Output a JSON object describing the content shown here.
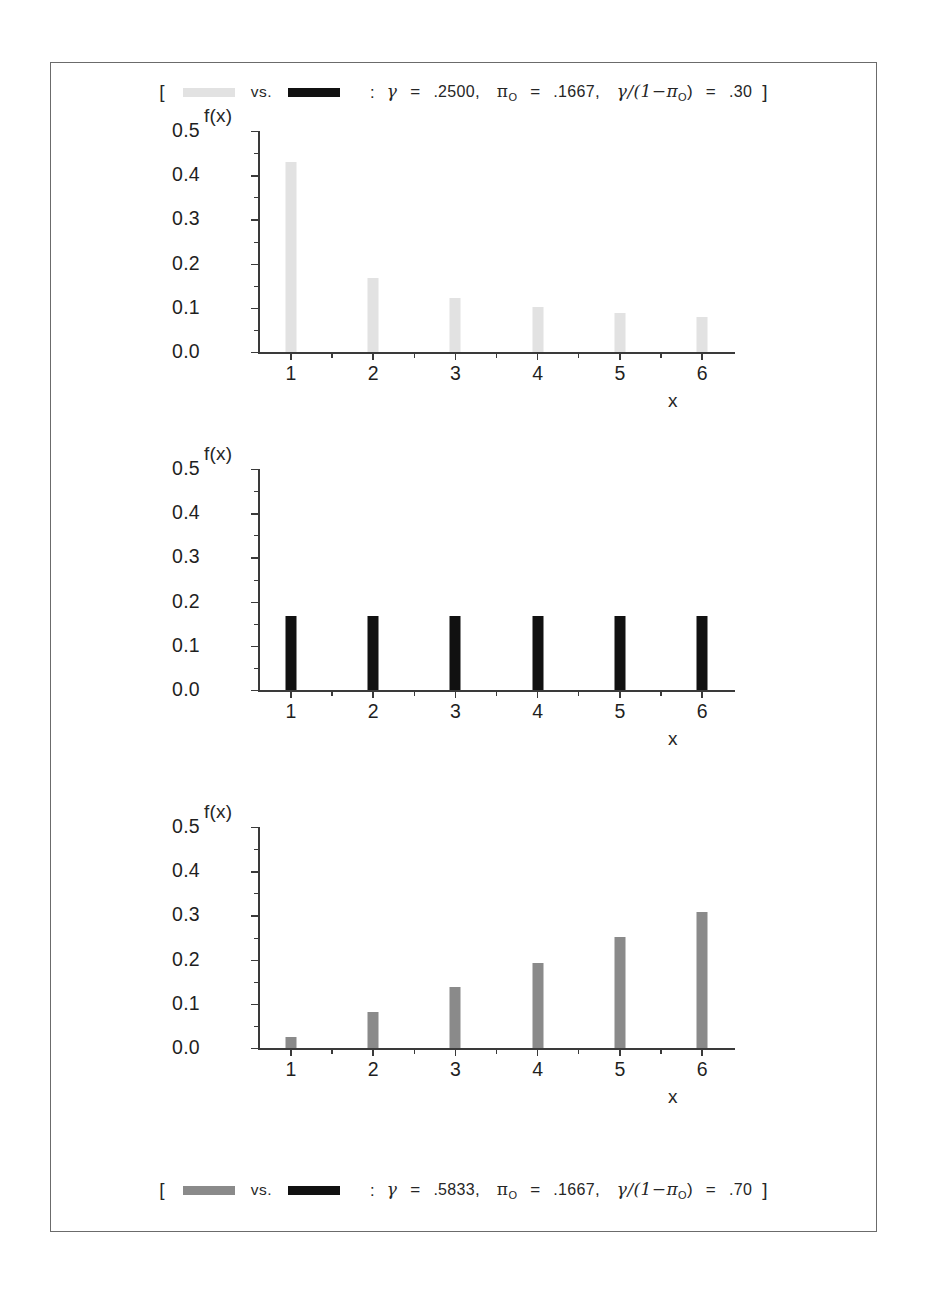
{
  "figure": {
    "caption_top": {
      "bracket_open": "[",
      "swatch_a_color": "#e2e2e2",
      "vs": "vs.",
      "swatch_b_color": "#111111",
      "colon": ":",
      "gamma": "γ",
      "eq1": "=",
      "gamma_value": ".2500",
      "comma1": ",",
      "pi": "π",
      "pi_sub": "O",
      "eq2": "=",
      "pi_value": ".1667",
      "comma2": ",",
      "ratio_expr": "γ/(1−π",
      "ratio_sub": "O",
      "ratio_close": ")",
      "eq3": "=",
      "ratio_value": ".30",
      "bracket_close": "]"
    },
    "caption_bottom": {
      "bracket_open": "[",
      "swatch_a_color": "#8a8a8a",
      "vs": "vs.",
      "swatch_b_color": "#111111",
      "colon": ":",
      "gamma": "γ",
      "eq1": "=",
      "gamma_value": ".5833",
      "comma1": ",",
      "pi": "π",
      "pi_sub": "O",
      "eq2": "=",
      "pi_value": ".1667",
      "comma2": ",",
      "ratio_expr": "γ/(1−π",
      "ratio_sub": "O",
      "ratio_close": ")",
      "eq3": "=",
      "ratio_value": ".70",
      "bracket_close": "]"
    }
  },
  "chart_data": [
    {
      "type": "bar",
      "title": "",
      "xlabel": "x",
      "ylabel": "f(x)",
      "categories": [
        "1",
        "2",
        "3",
        "4",
        "5",
        "6"
      ],
      "x": [
        1,
        2,
        3,
        4,
        5,
        6
      ],
      "values": [
        0.431,
        0.167,
        0.123,
        0.102,
        0.089,
        0.08
      ],
      "bar_color": "#e2e2e2",
      "ylim": [
        0.0,
        0.5
      ],
      "xlim": [
        0.6,
        6.4
      ],
      "yticks": [
        0.0,
        0.1,
        0.2,
        0.3,
        0.4,
        0.5
      ],
      "ytick_labels": [
        "0.0",
        "0.1",
        "0.2",
        "0.3",
        "0.4",
        "0.5"
      ],
      "grid": false,
      "legend": "none"
    },
    {
      "type": "bar",
      "title": "",
      "xlabel": "x",
      "ylabel": "f(x)",
      "categories": [
        "1",
        "2",
        "3",
        "4",
        "5",
        "6"
      ],
      "x": [
        1,
        2,
        3,
        4,
        5,
        6
      ],
      "values": [
        0.1667,
        0.1667,
        0.1667,
        0.1667,
        0.1667,
        0.1667
      ],
      "bar_color": "#111111",
      "ylim": [
        0.0,
        0.5
      ],
      "xlim": [
        0.6,
        6.4
      ],
      "yticks": [
        0.0,
        0.1,
        0.2,
        0.3,
        0.4,
        0.5
      ],
      "ytick_labels": [
        "0.0",
        "0.1",
        "0.2",
        "0.3",
        "0.4",
        "0.5"
      ],
      "grid": false,
      "legend": "none"
    },
    {
      "type": "bar",
      "title": "",
      "xlabel": "x",
      "ylabel": "f(x)",
      "categories": [
        "1",
        "2",
        "3",
        "4",
        "5",
        "6"
      ],
      "x": [
        1,
        2,
        3,
        4,
        5,
        6
      ],
      "values": [
        0.025,
        0.081,
        0.137,
        0.192,
        0.252,
        0.308
      ],
      "bar_color": "#8a8a8a",
      "ylim": [
        0.0,
        0.5
      ],
      "xlim": [
        0.6,
        6.4
      ],
      "yticks": [
        0.0,
        0.1,
        0.2,
        0.3,
        0.4,
        0.5
      ],
      "ytick_labels": [
        "0.0",
        "0.1",
        "0.2",
        "0.3",
        "0.4",
        "0.5"
      ],
      "grid": false,
      "legend": "none"
    }
  ]
}
